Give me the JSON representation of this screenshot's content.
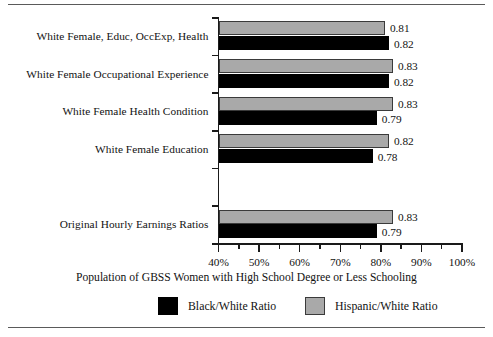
{
  "chart_data": {
    "type": "bar",
    "orientation": "horizontal",
    "title": "",
    "xlabel": "Population of GBSS Women with High School Degree or Less Schooling",
    "ylabel": "",
    "xlim": [
      0.4,
      1.0
    ],
    "xticks": [
      "40%",
      "50%",
      "60%",
      "70%",
      "80%",
      "90%",
      "100%"
    ],
    "xtick_values": [
      0.4,
      0.5,
      0.6,
      0.7,
      0.8,
      0.9,
      1.0
    ],
    "minor_ticks": true,
    "grid": false,
    "legend_position": "bottom",
    "categories": [
      "White Female, Educ, OccExp, Health",
      "White Female Occupational Experience",
      "White Female Health Condition",
      "White Female Education",
      "",
      "Original Hourly Earnings Ratios"
    ],
    "series": [
      {
        "name": "Black/White Ratio",
        "color": "#000000",
        "values": [
          0.82,
          0.82,
          0.79,
          0.78,
          null,
          0.79
        ],
        "labels": [
          "0.82",
          "0.82",
          "0.79",
          "0.78",
          "",
          "0.79"
        ]
      },
      {
        "name": "Hispanic/White Ratio",
        "color": "#a9a9a9",
        "values": [
          0.81,
          0.83,
          0.83,
          0.82,
          null,
          0.83
        ],
        "labels": [
          "0.81",
          "0.83",
          "0.83",
          "0.82",
          "",
          "0.83"
        ]
      }
    ]
  },
  "legend": {
    "items": [
      {
        "label": "Black/White Ratio",
        "swatch": "sw-black"
      },
      {
        "label": "Hispanic/White Ratio",
        "swatch": "sw-gray"
      }
    ]
  }
}
